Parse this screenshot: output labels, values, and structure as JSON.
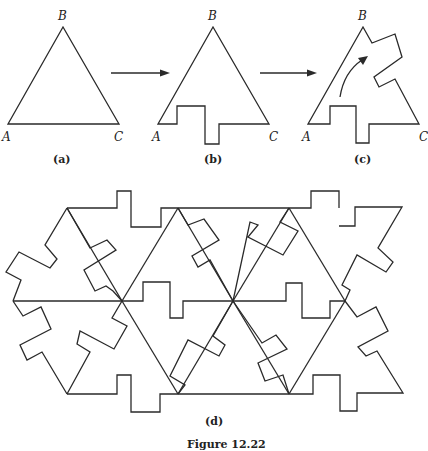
{
  "panels": {
    "a": {
      "caption": "(a)",
      "vertices": {
        "A": "A",
        "B": "B",
        "C": "C"
      }
    },
    "b": {
      "caption": "(b)",
      "vertices": {
        "A": "A",
        "B": "B",
        "C": "C"
      }
    },
    "c": {
      "caption": "(c)",
      "vertices": {
        "A": "A",
        "B": "B",
        "C": "C"
      }
    },
    "d": {
      "caption": "(d)"
    }
  },
  "figure_caption": "Figure 12.22",
  "colors": {
    "stroke": "#2a2a2a",
    "background": "#ffffff"
  }
}
